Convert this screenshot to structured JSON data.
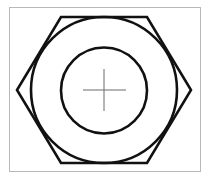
{
  "diagram": {
    "shapes": [
      {
        "name": "frame",
        "kind": "rectangle"
      },
      {
        "name": "hexagon",
        "kind": "regular-hexagon",
        "orientation": "flat-top"
      },
      {
        "name": "outer-circle",
        "kind": "circle",
        "relation": "inscribed in hexagon"
      },
      {
        "name": "inner-circle",
        "kind": "circle",
        "relation": "bore hole"
      },
      {
        "name": "center-mark",
        "kind": "crosshair"
      }
    ],
    "colors": {
      "stroke": "#111111",
      "frame": "#b8b8b8",
      "center_mark": "#6a6a6a",
      "background": "#ffffff"
    }
  }
}
